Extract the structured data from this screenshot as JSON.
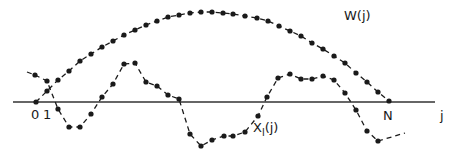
{
  "diagram": {
    "axis": {
      "y": 102,
      "x_start": 13,
      "x_end": 435,
      "color": "#333333",
      "labels": {
        "zero": "0",
        "one": "1",
        "n": "N",
        "j": "j"
      }
    },
    "curves": {
      "window": {
        "label": "W(j)",
        "label_pos": [
          344,
          20
        ],
        "color": "#1a1a1a",
        "points": [
          [
            36,
            102
          ],
          [
            47,
            91
          ],
          [
            58,
            80
          ],
          [
            69,
            71
          ],
          [
            80,
            61
          ],
          [
            91,
            54
          ],
          [
            102,
            47
          ],
          [
            113,
            41
          ],
          [
            124,
            35
          ],
          [
            135,
            30
          ],
          [
            146,
            25
          ],
          [
            157,
            21
          ],
          [
            168,
            17
          ],
          [
            179,
            15
          ],
          [
            190,
            13
          ],
          [
            201,
            12
          ],
          [
            212,
            12
          ],
          [
            223,
            13
          ],
          [
            233,
            14
          ],
          [
            245,
            16
          ],
          [
            257,
            18
          ],
          [
            268,
            21
          ],
          [
            279,
            26
          ],
          [
            290,
            31
          ],
          [
            301,
            36
          ],
          [
            312,
            43
          ],
          [
            323,
            49
          ],
          [
            334,
            56
          ],
          [
            345,
            63
          ],
          [
            356,
            73
          ],
          [
            367,
            82
          ],
          [
            378,
            92
          ],
          [
            389,
            101
          ]
        ]
      },
      "signal": {
        "label": "X",
        "label_sub": "l",
        "label_suffix": "(j)",
        "label_pos": [
          253,
          132
        ],
        "color": "#1a1a1a",
        "lead_in": [
          [
            27,
            72
          ],
          [
            35,
            75
          ]
        ],
        "lead_out": [
          [
            378,
            141
          ],
          [
            405,
            133
          ]
        ],
        "points": [
          [
            35,
            75
          ],
          [
            47,
            81
          ],
          [
            58,
            109
          ],
          [
            69,
            127
          ],
          [
            80,
            127
          ],
          [
            91,
            114
          ],
          [
            102,
            97
          ],
          [
            113,
            84
          ],
          [
            124,
            64
          ],
          [
            135,
            63
          ],
          [
            146,
            82
          ],
          [
            157,
            86
          ],
          [
            168,
            95
          ],
          [
            179,
            99
          ],
          [
            190,
            134
          ],
          [
            201,
            146
          ],
          [
            212,
            140
          ],
          [
            224,
            136
          ],
          [
            233,
            136
          ],
          [
            245,
            132
          ],
          [
            258,
            116
          ],
          [
            267,
            97
          ],
          [
            278,
            78
          ],
          [
            290,
            74
          ],
          [
            301,
            79
          ],
          [
            312,
            79
          ],
          [
            323,
            76
          ],
          [
            334,
            80
          ],
          [
            345,
            93
          ],
          [
            356,
            110
          ],
          [
            367,
            131
          ],
          [
            378,
            141
          ]
        ]
      }
    }
  }
}
